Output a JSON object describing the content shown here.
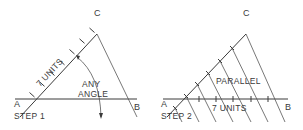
{
  "figure": {
    "line_color": "#3a3a3a",
    "background": "#ffffff"
  },
  "step1": {
    "label": "STEP 1",
    "point_a": "A",
    "point_b": "B",
    "point_c": "C",
    "units_label": "7 UNITS",
    "angle_label_line1": "ANY",
    "angle_label_line2": "ANGLE",
    "units_count": 7
  },
  "step2": {
    "label": "STEP 2",
    "point_a": "A",
    "point_b": "B",
    "point_c": "C",
    "parallel_label": "PARALLEL",
    "units_label": "7 UNITS",
    "units_count": 7
  }
}
